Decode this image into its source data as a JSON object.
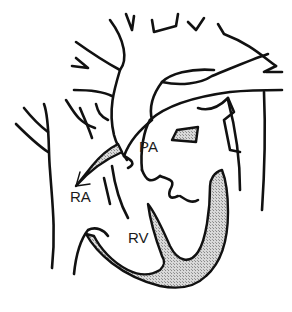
{
  "diagram": {
    "type": "anatomical-line-drawing",
    "labels": {
      "pa": "PA",
      "ra": "RA",
      "rv": "RV"
    },
    "colors": {
      "line": "#111111",
      "shading": "#bdbdbd",
      "background": "#ffffff"
    },
    "annotations": {
      "arrow": "flow arrow pointing into RA"
    }
  }
}
